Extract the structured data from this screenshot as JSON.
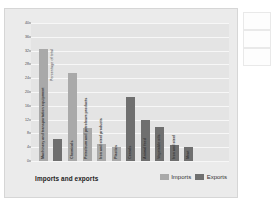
{
  "chart_data": {
    "type": "bar",
    "title": "Imports and exports",
    "xlabel": "",
    "ylabel": "Percentage of total",
    "ylim": [
      0,
      40
    ],
    "yticks": [
      0,
      4,
      8,
      12,
      16,
      20,
      24,
      28,
      32,
      36,
      40
    ],
    "grid": true,
    "legend_position": "bottom-right",
    "legend": [
      "Imports",
      "Exports"
    ],
    "categories": [
      "Machinery and transportation equipment",
      "Chemicals",
      "Petroleum and petroleum products",
      "Iron and steel products",
      "Plastics",
      "Cereals",
      "Animal feed",
      "Vegetable oils",
      "Iron and steel",
      "Meat"
    ],
    "bars": [
      {
        "label": "Machinery and transportation equipment",
        "series": "Imports",
        "value": 32.5
      },
      {
        "label": "Machinery and transportation equipment",
        "series": "Exports",
        "value": 6.5
      },
      {
        "label": "Chemicals",
        "series": "Imports",
        "value": 25.5
      },
      {
        "label": "Petroleum and petroleum products",
        "series": "Imports",
        "value": 9.5
      },
      {
        "label": "Iron and steel products",
        "series": "Imports",
        "value": 5.0
      },
      {
        "label": "Plastics",
        "series": "Imports",
        "value": 4.0
      },
      {
        "label": "Cereals",
        "series": "Exports",
        "value": 18.5
      },
      {
        "label": "Animal feed",
        "series": "Exports",
        "value": 12.0
      },
      {
        "label": "Vegetable oils",
        "series": "Exports",
        "value": 10.0
      },
      {
        "label": "Iron and steel",
        "series": "Exports",
        "value": 4.5
      },
      {
        "label": "Meat",
        "series": "Exports",
        "value": 4.0
      }
    ],
    "series": [
      {
        "name": "Imports",
        "color": "#a9a9a9",
        "points": [
          {
            "label": "Machinery and transportation equipment",
            "value": 32.5
          },
          {
            "label": "Chemicals",
            "value": 25.5
          },
          {
            "label": "Petroleum and petroleum products",
            "value": 9.5
          },
          {
            "label": "Iron and steel products",
            "value": 5.0
          },
          {
            "label": "Plastics",
            "value": 4.0
          }
        ]
      },
      {
        "name": "Exports",
        "color": "#6f6f6f",
        "points": [
          {
            "label": "Machinery and transportation equipment",
            "value": 6.5
          },
          {
            "label": "Cereals",
            "value": 18.5
          },
          {
            "label": "Animal feed",
            "value": 12.0
          },
          {
            "label": "Vegetable oils",
            "value": 10.0
          },
          {
            "label": "Iron and steel",
            "value": 4.5
          },
          {
            "label": "Meat",
            "value": 4.0
          }
        ]
      }
    ]
  },
  "colors": {
    "imports": "#a9a9a9",
    "exports": "#6f6f6f",
    "plot_background": "#e4e4e4",
    "card_background": "#ebebeb",
    "gridline": "#f7f7f7"
  }
}
